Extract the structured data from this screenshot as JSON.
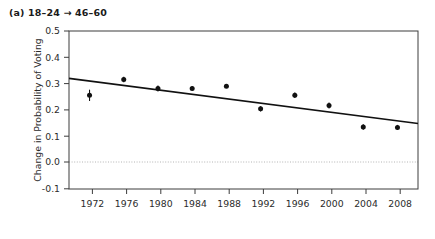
{
  "figure": {
    "panel_label": "(a) 18–24 → 46–60",
    "background_color": "#ffffff",
    "ink_color": "#1a1a1a",
    "zero_line_color": "#b4b4b4"
  },
  "chart_data": {
    "type": "scatter",
    "title": "(a) 18–24 → 46–60",
    "xlabel": "",
    "ylabel": "Change in Probability of Voting",
    "x": [
      1972,
      1976,
      1980,
      1984,
      1988,
      1992,
      1996,
      2000,
      2004,
      2008
    ],
    "xticklabels": [
      "1972",
      "1976",
      "1980",
      "1984",
      "1988",
      "1992",
      "1996",
      "2000",
      "2004",
      "2008"
    ],
    "values": [
      0.26,
      0.33,
      0.29,
      0.29,
      0.3,
      0.2,
      0.26,
      0.215,
      0.12,
      0.118
    ],
    "error_low": [
      0.235,
      0.318,
      0.277,
      0.281,
      0.292,
      0.188,
      0.248,
      0.202,
      0.108,
      0.107
    ],
    "error_high": [
      0.285,
      0.342,
      0.303,
      0.299,
      0.308,
      0.212,
      0.272,
      0.228,
      0.132,
      0.129
    ],
    "yticks": [
      -0.1,
      0.0,
      0.1,
      0.2,
      0.3,
      0.4,
      0.5
    ],
    "yticklabels": [
      "-0.1",
      "0.0",
      "0.1",
      "0.2",
      "0.3",
      "0.4",
      "0.5"
    ],
    "ylim": [
      -0.155,
      0.545
    ],
    "xlim": [
      1969.6,
      2010.4
    ],
    "grid": false,
    "legend": null,
    "zero_reference_line": 0.0,
    "trend_line": {
      "label": "fitted trend",
      "x_start": 1969.6,
      "y_start": 0.335,
      "x_end": 2010.4,
      "y_end": 0.135
    }
  },
  "axis": {
    "y_title": "Change in Probability of Voting",
    "y_ticks": [
      "0.5",
      "0.4",
      "0.3",
      "0.2",
      "0.1",
      "0.0",
      "-0.1"
    ],
    "x_ticks": [
      "1972",
      "1976",
      "1980",
      "1984",
      "1988",
      "1992",
      "1996",
      "2000",
      "2004",
      "2008"
    ]
  }
}
